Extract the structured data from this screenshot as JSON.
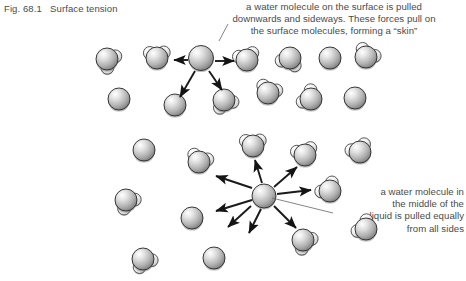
{
  "figure": {
    "caption": "Fig. 68.1   Surface tension",
    "background_color": "#ffffff",
    "text_color": "#4a4a4a",
    "ink_color": "#1a1a1a",
    "width": 466,
    "height": 281
  },
  "annotations": {
    "surface": {
      "text": "a water molecule on the surface is pulled\ndownwards and sideways. These forces pull on\nthe surface molecules, forming a “skin”",
      "leader_line": {
        "x1": 228,
        "y1": 24,
        "x2": 219,
        "y2": 41
      }
    },
    "interior": {
      "text": "a water molecule in\nthe middle of the\nliquid is pulled equally\nfrom all sides",
      "leader_line": {
        "x1": 333,
        "y1": 213,
        "x2": 272,
        "y2": 198
      }
    }
  },
  "molecules": {
    "radius_o": 11,
    "radius_h": 6.4,
    "surface_highlighted": {
      "cx": 201,
      "cy": 58,
      "r": 12.5,
      "plain": true
    },
    "interior_highlighted": {
      "cx": 264,
      "cy": 196,
      "r": 12.0,
      "plain": true
    },
    "list": [
      {
        "cx": 107,
        "cy": 59,
        "rot": 35,
        "plain": false
      },
      {
        "cx": 157,
        "cy": 58,
        "rot": 268,
        "plain": false
      },
      {
        "cx": 247,
        "cy": 60,
        "rot": 255,
        "plain": false
      },
      {
        "cx": 290,
        "cy": 58,
        "rot": 110,
        "plain": false
      },
      {
        "cx": 330,
        "cy": 58,
        "rot": 0,
        "plain": true
      },
      {
        "cx": 366,
        "cy": 57,
        "rot": 300,
        "plain": false
      },
      {
        "cx": 119,
        "cy": 99,
        "rot": 0,
        "plain": true
      },
      {
        "cx": 175,
        "cy": 105,
        "rot": 10,
        "plain": true
      },
      {
        "cx": 224,
        "cy": 100,
        "rot": 65,
        "plain": false
      },
      {
        "cx": 268,
        "cy": 93,
        "rot": 290,
        "plain": false
      },
      {
        "cx": 311,
        "cy": 99,
        "rot": 215,
        "plain": false
      },
      {
        "cx": 355,
        "cy": 98,
        "rot": 0,
        "plain": true
      },
      {
        "cx": 144,
        "cy": 150,
        "rot": 0,
        "plain": true
      },
      {
        "cx": 199,
        "cy": 162,
        "rot": 290,
        "plain": false
      },
      {
        "cx": 253,
        "cy": 146,
        "rot": 268,
        "plain": false
      },
      {
        "cx": 305,
        "cy": 155,
        "rot": 255,
        "plain": false
      },
      {
        "cx": 360,
        "cy": 152,
        "rot": 245,
        "plain": false
      },
      {
        "cx": 126,
        "cy": 200,
        "rot": 50,
        "plain": false
      },
      {
        "cx": 192,
        "cy": 218,
        "rot": 0,
        "plain": true
      },
      {
        "cx": 330,
        "cy": 191,
        "rot": 230,
        "plain": false
      },
      {
        "cx": 366,
        "cy": 229,
        "rot": 220,
        "plain": false
      },
      {
        "cx": 143,
        "cy": 259,
        "rot": 60,
        "plain": false
      },
      {
        "cx": 214,
        "cy": 258,
        "rot": 0,
        "plain": true
      },
      {
        "cx": 303,
        "cy": 240,
        "rot": 45,
        "plain": false
      }
    ]
  },
  "arrows": {
    "surface": [
      {
        "x1": 188,
        "y1": 60,
        "x2": 174,
        "y2": 60
      },
      {
        "x1": 215,
        "y1": 61,
        "x2": 234,
        "y2": 61
      },
      {
        "x1": 195,
        "y1": 71,
        "x2": 180,
        "y2": 97
      },
      {
        "x1": 209,
        "y1": 71,
        "x2": 222,
        "y2": 90
      }
    ],
    "interior": [
      {
        "x1": 252,
        "y1": 188,
        "x2": 216,
        "y2": 176
      },
      {
        "x1": 252,
        "y1": 200,
        "x2": 216,
        "y2": 211
      },
      {
        "x1": 262,
        "y1": 183,
        "x2": 255,
        "y2": 160
      },
      {
        "x1": 274,
        "y1": 187,
        "x2": 297,
        "y2": 167
      },
      {
        "x1": 277,
        "y1": 194,
        "x2": 311,
        "y2": 190
      },
      {
        "x1": 274,
        "y1": 206,
        "x2": 296,
        "y2": 228
      },
      {
        "x1": 261,
        "y1": 209,
        "x2": 249,
        "y2": 233
      },
      {
        "x1": 251,
        "y1": 206,
        "x2": 228,
        "y2": 227
      }
    ]
  }
}
